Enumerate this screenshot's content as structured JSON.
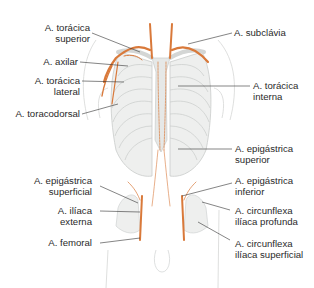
{
  "figure": {
    "colors": {
      "artery": "#d9793a",
      "bone": "#eeefee",
      "bone_outline": "#c9ccca",
      "leader": "#333333",
      "text": "#2a2a2a",
      "body_outline": "#d5d7d6"
    },
    "labels_left": [
      {
        "line1": "A. torácica",
        "line2": "superior"
      },
      {
        "line1": "A. axilar",
        "line2": ""
      },
      {
        "line1": "A. torácica",
        "line2": "lateral"
      },
      {
        "line1": "A. toracodorsal",
        "line2": ""
      },
      {
        "line1": "A. epigástrica",
        "line2": "superficial"
      },
      {
        "line1": "A. ilíaca",
        "line2": "externa"
      },
      {
        "line1": "A. femoral",
        "line2": ""
      }
    ],
    "labels_right": [
      {
        "line1": "A. subclávia",
        "line2": ""
      },
      {
        "line1": "A. torácica",
        "line2": "interna"
      },
      {
        "line1": "A. epigástrica",
        "line2": "superior"
      },
      {
        "line1": "A. epigástrica",
        "line2": "inferior"
      },
      {
        "line1": "A. circunflexa",
        "line2": "ilíaca profunda"
      },
      {
        "line1": "A. circunflexa",
        "line2": "ilíaca superficial"
      }
    ]
  }
}
